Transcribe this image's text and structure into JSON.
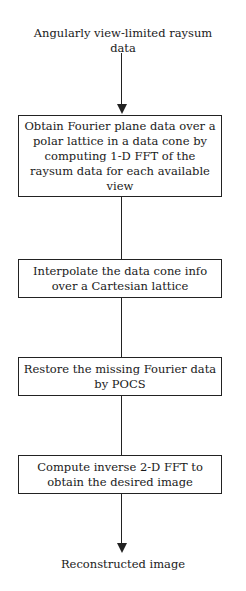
{
  "flowchart": {
    "input_label": "Angularly view-limited raysum data",
    "steps": [
      {
        "label": "Obtain Fourier plane data over a polar lattice in a data cone by computing 1-D FFT of the raysum data for each available view"
      },
      {
        "label": "Interpolate the data cone info over a Cartesian lattice"
      },
      {
        "label": "Restore the missing Fourier data by POCS"
      },
      {
        "label": "Compute inverse 2-D FFT to obtain the desired image"
      }
    ],
    "output_label": "Reconstructed image"
  }
}
